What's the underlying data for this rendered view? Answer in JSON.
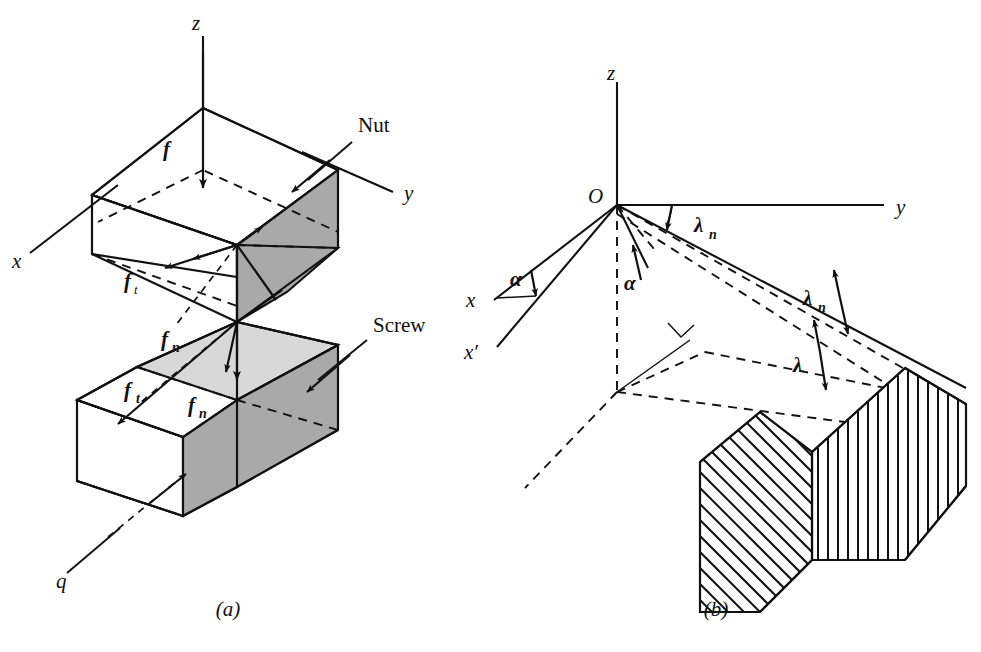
{
  "figure": {
    "background_color": "#ffffff",
    "line_color": "#111111",
    "shade_dark": "#a9a9a9",
    "shade_light": "#d8d8d8"
  },
  "panel_a": {
    "caption": "(a)",
    "axes": [
      {
        "name": "z-axis-label",
        "label": "z"
      },
      {
        "name": "y-axis-label",
        "label": "y"
      },
      {
        "name": "x-axis-label",
        "label": "x"
      }
    ],
    "part_labels": [
      {
        "name": "nut-label",
        "label": "Nut"
      },
      {
        "name": "screw-label",
        "label": "Screw"
      }
    ],
    "force_labels": [
      {
        "name": "force-f",
        "symbol": "f",
        "subscript": ""
      },
      {
        "name": "force-ft-upper",
        "symbol": "f",
        "subscript": "t"
      },
      {
        "name": "force-fn-upper",
        "symbol": "f",
        "subscript": "n"
      },
      {
        "name": "force-ft-lower",
        "symbol": "f",
        "subscript": "t"
      },
      {
        "name": "force-fn-lower",
        "symbol": "f",
        "subscript": "n"
      },
      {
        "name": "load-q",
        "symbol": "q",
        "subscript": ""
      }
    ]
  },
  "panel_b": {
    "caption": "(b)",
    "origin_label": "O",
    "axes": [
      {
        "name": "z-axis-label",
        "label": "z"
      },
      {
        "name": "y-axis-label",
        "label": "y"
      },
      {
        "name": "x-axis-label",
        "label": "x"
      },
      {
        "name": "x-prime-axis-label",
        "label": "x′"
      }
    ],
    "angle_labels": [
      {
        "name": "angle-alpha-left",
        "symbol": "α",
        "subscript": ""
      },
      {
        "name": "angle-alpha-center",
        "symbol": "α",
        "subscript": ""
      },
      {
        "name": "angle-lambda-n-top",
        "symbol": "λ",
        "subscript": "n"
      },
      {
        "name": "angle-lambda-n-mid",
        "symbol": "λ",
        "subscript": "n"
      },
      {
        "name": "angle-lambda",
        "symbol": "λ",
        "subscript": ""
      }
    ]
  }
}
